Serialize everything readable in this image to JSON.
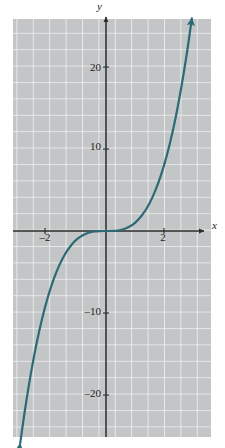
{
  "figure": {
    "kind": "cartesian-graph",
    "background_color": "#ffffff",
    "plot_area": {
      "fill_color": "#c3c5c6",
      "grid_color": "#f2f3f3",
      "left": 13,
      "top": 19,
      "width": 198,
      "height": 418,
      "grid_spacing_px": 16.4,
      "grid_visible": true
    },
    "axes": {
      "color": "#2b2b2b",
      "x_axis_label": "x",
      "y_axis_label": "y",
      "x_axis_pixel_y": 231,
      "y_axis_pixel_x": 106,
      "x_arrow_end_px": 207,
      "y_arrow_end_px": 14
    },
    "x_ticks": [
      {
        "value": -2,
        "label": "–2"
      },
      {
        "value": 2,
        "label": "2"
      }
    ],
    "y_ticks": [
      {
        "value": 20,
        "label": "20"
      },
      {
        "value": 10,
        "label": "10"
      },
      {
        "value": -10,
        "label": "–10"
      },
      {
        "value": -20,
        "label": "–20"
      }
    ]
  },
  "chart_data": {
    "type": "line",
    "title": "",
    "subtitle": "",
    "xlabel": "x",
    "ylabel": "y",
    "xlim": [
      -3.2,
      3.5
    ],
    "ylim": [
      -26,
      26
    ],
    "grid": true,
    "legend": null,
    "annotations": [],
    "curve_color": "#2c6a76",
    "curve_width_px": 2.2,
    "arrowheads": [
      "start",
      "end"
    ],
    "series": [
      {
        "name": "y = x³",
        "equation": "y = x^3",
        "x": [
          -2.96,
          -2.8,
          -2.6,
          -2.4,
          -2.2,
          -2.0,
          -1.8,
          -1.6,
          -1.4,
          -1.2,
          -1.0,
          -0.8,
          -0.6,
          -0.4,
          -0.2,
          0.0,
          0.2,
          0.4,
          0.6,
          0.8,
          1.0,
          1.2,
          1.4,
          1.6,
          1.8,
          2.0,
          2.2,
          2.4,
          2.6,
          2.8,
          2.96
        ],
        "values": [
          -25.93,
          -21.95,
          -17.58,
          -13.82,
          -10.65,
          -8.0,
          -5.83,
          -4.1,
          -2.74,
          -1.73,
          -1.0,
          -0.51,
          -0.22,
          -0.06,
          -0.01,
          0.0,
          0.01,
          0.06,
          0.22,
          0.51,
          1.0,
          1.73,
          2.74,
          4.1,
          5.83,
          8.0,
          10.65,
          13.82,
          17.58,
          21.95,
          25.93
        ]
      }
    ],
    "x_tick_values": [
      -2,
      2
    ],
    "x_tick_labels": [
      "–2",
      "2"
    ],
    "y_tick_values": [
      20,
      10,
      -10,
      -20
    ],
    "y_tick_labels": [
      "20",
      "10",
      "–10",
      "–20"
    ]
  }
}
